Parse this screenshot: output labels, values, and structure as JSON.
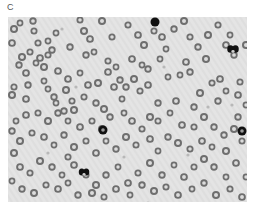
{
  "figure": {
    "panel_label": "C",
    "image": {
      "description": "Grayscale light-microscopy blood smear showing numerous red blood cells (ring-shaped, pale centers) and a few darkly stained white blood cells",
      "background_color": "#e4e4e4",
      "stripe_color": "#d9d9d9",
      "rbc_ring_color": "#6e6e6e",
      "rbc_center_color": "#dcdcdc",
      "wbc_color": "#111111",
      "rbc_cells": [
        [
          12,
          6
        ],
        [
          25,
          4
        ],
        [
          6,
          12
        ],
        [
          26,
          14
        ],
        [
          4,
          26
        ],
        [
          40,
          24
        ],
        [
          44,
          33
        ],
        [
          14,
          40
        ],
        [
          22,
          35
        ],
        [
          32,
          41
        ],
        [
          28,
          46
        ],
        [
          11,
          48
        ],
        [
          36,
          50
        ],
        [
          40,
          38
        ],
        [
          50,
          54
        ],
        [
          36,
          64
        ],
        [
          20,
          68
        ],
        [
          4,
          78
        ],
        [
          6,
          70
        ],
        [
          18,
          82
        ],
        [
          40,
          72
        ],
        [
          46,
          80
        ],
        [
          58,
          73
        ],
        [
          64,
          84
        ],
        [
          60,
          62
        ],
        [
          48,
          86
        ],
        [
          56,
          94
        ],
        [
          66,
          93
        ],
        [
          76,
          80
        ],
        [
          80,
          68
        ],
        [
          72,
          56
        ],
        [
          62,
          30
        ],
        [
          76,
          14
        ],
        [
          72,
          3
        ],
        [
          82,
          22
        ],
        [
          86,
          35
        ],
        [
          78,
          38
        ],
        [
          94,
          4
        ],
        [
          104,
          20
        ],
        [
          100,
          55
        ],
        [
          108,
          50
        ],
        [
          112,
          63
        ],
        [
          90,
          66
        ],
        [
          100,
          44
        ],
        [
          106,
          70
        ],
        [
          114,
          82
        ],
        [
          118,
          70
        ],
        [
          126,
          62
        ],
        [
          132,
          74
        ],
        [
          124,
          42
        ],
        [
          134,
          48
        ],
        [
          140,
          52
        ],
        [
          136,
          28
        ],
        [
          146,
          14
        ],
        [
          154,
          20
        ],
        [
          158,
          32
        ],
        [
          166,
          12
        ],
        [
          176,
          4
        ],
        [
          182,
          20
        ],
        [
          178,
          45
        ],
        [
          172,
          58
        ],
        [
          182,
          55
        ],
        [
          198,
          42
        ],
        [
          210,
          8
        ],
        [
          218,
          28
        ],
        [
          222,
          18
        ],
        [
          226,
          38
        ],
        [
          238,
          28
        ],
        [
          232,
          65
        ],
        [
          230,
          78
        ],
        [
          238,
          88
        ],
        [
          186,
          90
        ],
        [
          192,
          76
        ],
        [
          204,
          66
        ],
        [
          212,
          62
        ],
        [
          218,
          74
        ],
        [
          210,
          84
        ],
        [
          196,
          100
        ],
        [
          186,
          110
        ],
        [
          174,
          108
        ],
        [
          162,
          96
        ],
        [
          150,
          86
        ],
        [
          142,
          100
        ],
        [
          134,
          112
        ],
        [
          124,
          104
        ],
        [
          116,
          96
        ],
        [
          102,
          100
        ],
        [
          94,
          112
        ],
        [
          84,
          104
        ],
        [
          72,
          110
        ],
        [
          60,
          104
        ],
        [
          50,
          96
        ],
        [
          40,
          104
        ],
        [
          30,
          96
        ],
        [
          18,
          98
        ],
        [
          8,
          104
        ],
        [
          4,
          114
        ],
        [
          12,
          124
        ],
        [
          24,
          116
        ],
        [
          36,
          120
        ],
        [
          46,
          128
        ],
        [
          56,
          118
        ],
        [
          66,
          130
        ],
        [
          78,
          124
        ],
        [
          88,
          136
        ],
        [
          98,
          124
        ],
        [
          108,
          132
        ],
        [
          118,
          120
        ],
        [
          128,
          128
        ],
        [
          142,
          122
        ],
        [
          150,
          134
        ],
        [
          160,
          120
        ],
        [
          170,
          126
        ],
        [
          182,
          132
        ],
        [
          194,
          124
        ],
        [
          204,
          130
        ],
        [
          216,
          118
        ],
        [
          226,
          112
        ],
        [
          234,
          124
        ],
        [
          228,
          146
        ],
        [
          218,
          160
        ],
        [
          206,
          150
        ],
        [
          196,
          142
        ],
        [
          186,
          150
        ],
        [
          176,
          160
        ],
        [
          166,
          148
        ],
        [
          154,
          158
        ],
        [
          142,
          146
        ],
        [
          130,
          156
        ],
        [
          120,
          166
        ],
        [
          110,
          150
        ],
        [
          98,
          158
        ],
        [
          88,
          168
        ],
        [
          78,
          158
        ],
        [
          66,
          148
        ],
        [
          54,
          158
        ],
        [
          44,
          150
        ],
        [
          32,
          144
        ],
        [
          22,
          156
        ],
        [
          12,
          150
        ],
        [
          4,
          164
        ],
        [
          14,
          172
        ],
        [
          26,
          176
        ],
        [
          38,
          168
        ],
        [
          50,
          172
        ],
        [
          60,
          166
        ],
        [
          70,
          178
        ],
        [
          84,
          176
        ],
        [
          96,
          180
        ],
        [
          108,
          172
        ],
        [
          122,
          178
        ],
        [
          134,
          168
        ],
        [
          146,
          174
        ],
        [
          158,
          170
        ],
        [
          170,
          178
        ],
        [
          184,
          172
        ],
        [
          196,
          166
        ],
        [
          208,
          178
        ],
        [
          222,
          172
        ],
        [
          234,
          180
        ],
        [
          238,
          160
        ],
        [
          230,
          100
        ],
        [
          6,
          136
        ],
        [
          60,
          140
        ],
        [
          140,
          68
        ],
        [
          152,
          42
        ],
        [
          190,
          30
        ],
        [
          200,
          18
        ],
        [
          120,
          8
        ],
        [
          130,
          18
        ],
        [
          160,
          60
        ],
        [
          88,
          86
        ],
        [
          96,
          92
        ],
        [
          30,
          26
        ],
        [
          18,
          56
        ],
        [
          48,
          16
        ],
        [
          206,
          110
        ],
        [
          218,
          134
        ],
        [
          150,
          104
        ],
        [
          168,
          84
        ]
      ],
      "wbc_cells": [
        {
          "x": 147,
          "y": 5,
          "r": 4.5,
          "shape": "round"
        },
        {
          "x": 225,
          "y": 32,
          "r": 5.5,
          "shape": "lobed"
        },
        {
          "x": 95,
          "y": 113,
          "r": 4.5,
          "shape": "ring"
        },
        {
          "x": 76,
          "y": 155,
          "r": 5,
          "shape": "lobed"
        },
        {
          "x": 234,
          "y": 114,
          "r": 4.5,
          "shape": "ring"
        }
      ],
      "debris": [
        [
          54,
          12
        ],
        [
          68,
          70
        ],
        [
          156,
          50
        ],
        [
          200,
          90
        ],
        [
          116,
          140
        ],
        [
          40,
          136
        ],
        [
          180,
          138
        ],
        [
          224,
          88
        ],
        [
          140,
          186
        ]
      ]
    }
  }
}
